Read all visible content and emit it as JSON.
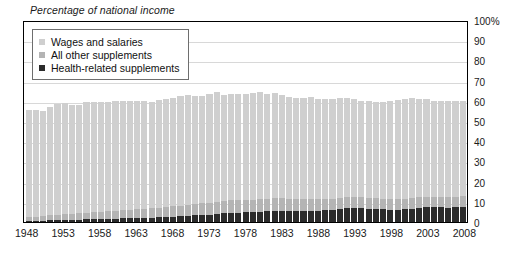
{
  "chart_data": {
    "type": "bar",
    "title": "Percentage of national income",
    "subtitle": "",
    "xlabel": "",
    "ylabel": "",
    "stacked": true,
    "grid": true,
    "legend_position": "top-left",
    "ylim": [
      0,
      100
    ],
    "y_ticks": [
      "0",
      "10",
      "20",
      "30",
      "40",
      "50",
      "60",
      "70",
      "80",
      "90",
      "100%"
    ],
    "y_tick_values": [
      0,
      10,
      20,
      30,
      40,
      50,
      60,
      70,
      80,
      90,
      100
    ],
    "x_tick_labels": [
      "1948",
      "1953",
      "1958",
      "1963",
      "1968",
      "1973",
      "1978",
      "1983",
      "1988",
      "1993",
      "1998",
      "2003",
      "2008"
    ],
    "x_tick_values": [
      1948,
      1953,
      1958,
      1963,
      1968,
      1973,
      1978,
      1983,
      1988,
      1993,
      1998,
      2003,
      2008
    ],
    "categories": [
      1948,
      1949,
      1950,
      1951,
      1952,
      1953,
      1954,
      1955,
      1956,
      1957,
      1958,
      1959,
      1960,
      1961,
      1962,
      1963,
      1964,
      1965,
      1966,
      1967,
      1968,
      1969,
      1970,
      1971,
      1972,
      1973,
      1974,
      1975,
      1976,
      1977,
      1978,
      1979,
      1980,
      1981,
      1982,
      1983,
      1984,
      1985,
      1986,
      1987,
      1988,
      1989,
      1990,
      1991,
      1992,
      1993,
      1994,
      1995,
      1996,
      1997,
      1998,
      1999,
      2000,
      2001,
      2002,
      2003,
      2004,
      2005,
      2006,
      2007,
      2008
    ],
    "series": [
      {
        "name": "Wages and salaries",
        "color": "#cfcfcf",
        "values": [
          53.0,
          52.6,
          52.2,
          53.6,
          54.6,
          54.8,
          53.8,
          53.5,
          54.5,
          54.6,
          54.1,
          53.9,
          54.3,
          53.9,
          53.7,
          53.4,
          53.1,
          52.5,
          53.1,
          53.5,
          53.6,
          54.2,
          54.4,
          53.4,
          53.4,
          53.7,
          54.1,
          52.5,
          52.6,
          52.4,
          52.4,
          52.7,
          52.8,
          51.8,
          51.9,
          51.1,
          50.3,
          50.2,
          50.4,
          50.5,
          49.8,
          49.4,
          49.4,
          49.1,
          48.9,
          48.3,
          47.7,
          47.6,
          47.6,
          47.9,
          48.7,
          49.1,
          49.6,
          49.4,
          48.5,
          48.2,
          47.4,
          47.1,
          47.2,
          47.2,
          46.8
        ]
      },
      {
        "name": "All other supplements",
        "color": "#b4b4b4",
        "values": [
          2.0,
          2.1,
          2.3,
          2.5,
          2.7,
          2.9,
          3.1,
          3.2,
          3.4,
          3.6,
          3.7,
          3.9,
          4.0,
          4.1,
          4.3,
          4.4,
          4.5,
          4.6,
          4.8,
          5.0,
          5.1,
          5.2,
          5.4,
          5.6,
          5.7,
          5.9,
          6.1,
          6.2,
          6.2,
          6.2,
          6.1,
          6.1,
          6.2,
          6.3,
          6.3,
          6.2,
          6.0,
          5.9,
          5.8,
          5.7,
          5.6,
          5.5,
          5.5,
          5.6,
          5.7,
          5.7,
          5.6,
          5.5,
          5.3,
          5.2,
          5.1,
          5.1,
          5.1,
          5.2,
          5.3,
          5.4,
          5.4,
          5.4,
          5.4,
          5.4,
          5.5
        ]
      },
      {
        "name": "Health-related supplements",
        "color": "#2b2b2b",
        "values": [
          0.5,
          0.6,
          0.7,
          0.8,
          0.9,
          1.0,
          1.1,
          1.2,
          1.3,
          1.4,
          1.5,
          1.6,
          1.7,
          1.8,
          1.9,
          2.0,
          2.1,
          2.2,
          2.3,
          2.5,
          2.7,
          2.9,
          3.1,
          3.3,
          3.5,
          3.7,
          4.0,
          4.3,
          4.5,
          4.7,
          4.8,
          4.9,
          5.2,
          5.3,
          5.5,
          5.6,
          5.5,
          5.4,
          5.4,
          5.5,
          5.6,
          5.8,
          6.1,
          6.5,
          6.8,
          6.9,
          6.8,
          6.6,
          6.4,
          6.2,
          6.1,
          6.1,
          6.2,
          6.6,
          7.0,
          7.2,
          7.2,
          7.2,
          7.1,
          7.2,
          7.4
        ]
      }
    ]
  },
  "legend": {
    "items": [
      {
        "label": "Wages and salaries",
        "color": "#cfcfcf"
      },
      {
        "label": "All other supplements",
        "color": "#b4b4b4"
      },
      {
        "label": "Health-related supplements",
        "color": "#2b2b2b"
      }
    ]
  },
  "colors": {
    "wages": "#cfcfcf",
    "other_supplements": "#b4b4b4",
    "health_supplements": "#2b2b2b",
    "gridline": "#d8d8d8",
    "frame": "#000000",
    "text": "#1a1a1a"
  }
}
